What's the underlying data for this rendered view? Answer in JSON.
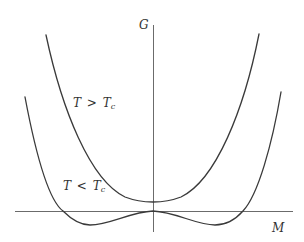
{
  "diagram": {
    "title": "",
    "axes": {
      "vertical_label": "G",
      "horizontal_label": "M"
    },
    "curves": [
      {
        "id": "above-critical",
        "label_T": "T",
        "label_op": ">",
        "label_Tc": "T",
        "label_sub": "c",
        "shape": "single-well"
      },
      {
        "id": "below-critical",
        "label_T": "T",
        "label_op": "<",
        "label_Tc": "T",
        "label_sub": "c",
        "shape": "double-well"
      }
    ],
    "colors": {
      "background": "#ffffff",
      "curve": "#3a3a3a",
      "axis": "#6b6b6b",
      "text": "#333333"
    }
  }
}
